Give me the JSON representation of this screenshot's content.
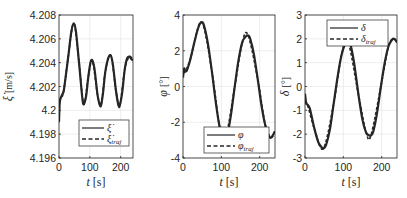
{
  "chart_data": [
    {
      "type": "line",
      "title": "",
      "xlabel": "t [s]",
      "ylabel": "ξ̇ [m/s]",
      "xlim": [
        0,
        240
      ],
      "ylim": [
        4.196,
        4.208
      ],
      "xticks": [
        0,
        100,
        200
      ],
      "yticks": [
        4.196,
        4.198,
        4.2,
        4.202,
        4.204,
        4.206,
        4.208
      ],
      "ytick_labels": [
        "4.196",
        "4.198",
        "4.2",
        "4.202",
        "4.204",
        "4.206",
        "4.208"
      ],
      "grid": true,
      "legend_position": "lower center",
      "legend": [
        "ξ̇",
        "ξ̇_traj"
      ],
      "series": [
        {
          "name": "ξ̇",
          "style": "solid",
          "x": [
            0,
            2,
            5,
            10,
            15,
            20,
            30,
            40,
            48,
            55,
            65,
            75,
            80,
            88,
            95,
            102,
            108,
            115,
            125,
            133,
            137,
            143,
            150,
            160,
            168,
            175,
            185,
            193,
            197,
            205,
            213,
            220,
            228,
            235,
            240
          ],
          "y": [
            4.199,
            4.2005,
            4.201,
            4.2013,
            4.2016,
            4.2025,
            4.2045,
            4.2066,
            4.2073,
            4.2066,
            4.204,
            4.2012,
            4.2005,
            4.2012,
            4.2028,
            4.204,
            4.2042,
            4.2035,
            4.2013,
            4.2004,
            4.2005,
            4.2015,
            4.2032,
            4.2044,
            4.2046,
            4.2038,
            4.2016,
            4.2004,
            4.2004,
            4.2015,
            4.2034,
            4.2043,
            4.2045,
            4.2043,
            4.2042
          ]
        },
        {
          "name": "ξ̇_traj",
          "style": "dashed",
          "x": [
            0,
            5,
            15,
            30,
            48,
            65,
            80,
            95,
            108,
            125,
            137,
            150,
            168,
            185,
            197,
            213,
            228,
            240
          ],
          "y": [
            4.2008,
            4.201,
            4.2016,
            4.2045,
            4.2073,
            4.204,
            4.2005,
            4.2028,
            4.2042,
            4.2013,
            4.2005,
            4.2032,
            4.2046,
            4.2016,
            4.2004,
            4.2034,
            4.2045,
            4.2042
          ]
        }
      ]
    },
    {
      "type": "line",
      "title": "",
      "xlabel": "t [s]",
      "ylabel": "φ [°]",
      "xlim": [
        0,
        240
      ],
      "ylim": [
        -4,
        4
      ],
      "xticks": [
        0,
        100,
        200
      ],
      "yticks": [
        -4,
        -2,
        0,
        2,
        4
      ],
      "ytick_labels": [
        "-4",
        "-2",
        "0",
        "2",
        "4"
      ],
      "grid": true,
      "legend_position": "lower center",
      "legend": [
        "φ",
        "φ_traj"
      ],
      "series": [
        {
          "name": "φ",
          "style": "solid",
          "x": [
            0,
            3,
            6,
            10,
            15,
            20,
            30,
            40,
            48,
            55,
            65,
            75,
            85,
            95,
            105,
            110,
            115,
            125,
            135,
            145,
            155,
            165,
            170,
            175,
            185,
            195,
            205,
            215,
            225,
            230,
            235,
            240
          ],
          "y": [
            0.5,
            1.0,
            0.85,
            0.9,
            1.2,
            1.6,
            2.5,
            3.3,
            3.6,
            3.4,
            2.4,
            0.9,
            -0.8,
            -2.2,
            -2.95,
            -3.0,
            -2.8,
            -1.6,
            0.0,
            1.5,
            2.5,
            2.82,
            2.85,
            2.7,
            1.8,
            0.4,
            -1.1,
            -2.2,
            -2.8,
            -2.85,
            -2.7,
            -2.5
          ]
        },
        {
          "name": "φ_traj",
          "style": "dashed",
          "x": [
            0,
            6,
            20,
            48,
            75,
            95,
            110,
            135,
            155,
            170,
            195,
            215,
            230,
            240
          ],
          "y": [
            0.8,
            0.85,
            1.6,
            3.6,
            0.9,
            -2.2,
            -3.0,
            0.0,
            2.5,
            2.85,
            0.4,
            -2.2,
            -2.85,
            -2.5
          ]
        }
      ]
    },
    {
      "type": "line",
      "title": "",
      "xlabel": "t [s]",
      "ylabel": "δ [°]",
      "xlim": [
        0,
        240
      ],
      "ylim": [
        -3,
        3
      ],
      "xticks": [
        0,
        100,
        200
      ],
      "yticks": [
        -3,
        -2,
        -1,
        0,
        1,
        2,
        3
      ],
      "ytick_labels": [
        "-3",
        "-2",
        "-1",
        "0",
        "1",
        "2",
        "3"
      ],
      "grid": true,
      "legend_position": "upper right",
      "legend": [
        "δ",
        "δ_traj"
      ],
      "series": [
        {
          "name": "δ",
          "style": "solid",
          "x": [
            0,
            3,
            6,
            12,
            18,
            25,
            35,
            45,
            48,
            55,
            65,
            75,
            85,
            95,
            105,
            112,
            118,
            128,
            140,
            150,
            160,
            168,
            172,
            178,
            188,
            198,
            208,
            218,
            228,
            232,
            236,
            240
          ],
          "y": [
            -0.3,
            -0.7,
            -0.75,
            -0.9,
            -1.3,
            -1.8,
            -2.35,
            -2.58,
            -2.6,
            -2.45,
            -1.8,
            -0.7,
            0.4,
            1.3,
            1.8,
            1.9,
            1.8,
            1.0,
            -0.4,
            -1.4,
            -1.95,
            -2.05,
            -2.05,
            -1.9,
            -1.1,
            0.0,
            1.0,
            1.7,
            1.98,
            2.0,
            1.95,
            1.85
          ]
        },
        {
          "name": "δ_traj",
          "style": "dashed",
          "x": [
            0,
            6,
            25,
            48,
            75,
            95,
            112,
            140,
            160,
            172,
            198,
            218,
            232,
            240
          ],
          "y": [
            -0.7,
            -0.75,
            -1.8,
            -2.6,
            -0.7,
            1.3,
            1.9,
            -0.4,
            -1.95,
            -2.05,
            0.0,
            1.7,
            2.0,
            1.85
          ]
        }
      ]
    }
  ],
  "panels": [
    {
      "ylabel_main": "ξ̇",
      "ylabel_unit": "[m/s]",
      "xlabel_var": "t",
      "xlabel_unit": "[s]",
      "legend_1": "ξ̇",
      "legend_2_base": "ξ̇",
      "legend_2_sub": "traj"
    },
    {
      "ylabel_main": "φ",
      "ylabel_unit": "[°]",
      "xlabel_var": "t",
      "xlabel_unit": "[s]",
      "legend_1": "φ",
      "legend_2_base": "φ",
      "legend_2_sub": "traj"
    },
    {
      "ylabel_main": "δ",
      "ylabel_unit": "[°]",
      "xlabel_var": "t",
      "xlabel_unit": "[s]",
      "legend_1": "δ",
      "legend_2_base": "δ",
      "legend_2_sub": "traj"
    }
  ],
  "colors": {
    "line": "#262626",
    "axis": "#262626",
    "grid": "#e6e6e6",
    "background": "#ffffff"
  }
}
